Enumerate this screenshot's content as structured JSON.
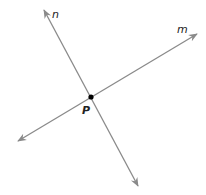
{
  "diagram": {
    "lines": [
      {
        "name": "n",
        "label": "n",
        "from": [
          44,
          10
        ],
        "to": [
          138,
          186
        ]
      },
      {
        "name": "m",
        "label": "m",
        "from": [
          18,
          141
        ],
        "to": [
          197,
          34
        ]
      }
    ],
    "point": {
      "name": "P",
      "label": "P",
      "x": 91,
      "y": 97
    },
    "colors": {
      "line": "#8a8a8a",
      "point": "#000000",
      "text": "#222222"
    }
  }
}
